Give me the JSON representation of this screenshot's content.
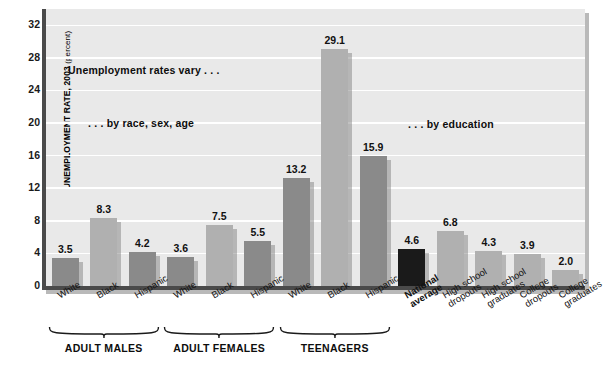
{
  "chart_data": {
    "type": "bar",
    "title": "",
    "xlabel": "",
    "ylabel": "UNEMPLOYMENT RATE, 2003",
    "ylabel_unit": "(percent)",
    "ylim": [
      0,
      34
    ],
    "yticks": [
      0,
      4,
      8,
      12,
      16,
      20,
      24,
      28,
      32
    ],
    "grid": true,
    "legend": "none",
    "categories": [
      "White",
      "Black",
      "Hispanic",
      "White",
      "Black",
      "Hispanic",
      "White",
      "Black",
      "Hispanic",
      "National average",
      "High school dropouts",
      "High school graduates",
      "College dropouts",
      "College graduates"
    ],
    "values": [
      3.5,
      8.3,
      4.2,
      3.6,
      7.5,
      5.5,
      13.2,
      29.1,
      15.9,
      4.6,
      6.8,
      4.3,
      3.9,
      2.0
    ],
    "bars": [
      {
        "label": "White",
        "label_lines": [
          "White"
        ],
        "value": 3.5,
        "shade": "dark",
        "bold": false
      },
      {
        "label": "Black",
        "label_lines": [
          "Black"
        ],
        "value": 8.3,
        "shade": "light",
        "bold": false
      },
      {
        "label": "Hispanic",
        "label_lines": [
          "Hispanic"
        ],
        "value": 4.2,
        "shade": "dark",
        "bold": false
      },
      {
        "label": "White",
        "label_lines": [
          "White"
        ],
        "value": 3.6,
        "shade": "dark",
        "bold": false
      },
      {
        "label": "Black",
        "label_lines": [
          "Black"
        ],
        "value": 7.5,
        "shade": "light",
        "bold": false
      },
      {
        "label": "Hispanic",
        "label_lines": [
          "Hispanic"
        ],
        "value": 5.5,
        "shade": "dark",
        "bold": false
      },
      {
        "label": "White",
        "label_lines": [
          "White"
        ],
        "value": 13.2,
        "shade": "dark",
        "bold": false
      },
      {
        "label": "Black",
        "label_lines": [
          "Black"
        ],
        "value": 29.1,
        "shade": "light",
        "bold": false
      },
      {
        "label": "Hispanic",
        "label_lines": [
          "Hispanic"
        ],
        "value": 15.9,
        "shade": "dark",
        "bold": false
      },
      {
        "label": "National average",
        "label_lines": [
          "National",
          "average"
        ],
        "value": 4.6,
        "shade": "black",
        "bold": true
      },
      {
        "label": "High school dropouts",
        "label_lines": [
          "High school",
          "dropouts"
        ],
        "value": 6.8,
        "shade": "light",
        "bold": false
      },
      {
        "label": "High school graduates",
        "label_lines": [
          "High school",
          "graduates"
        ],
        "value": 4.3,
        "shade": "light",
        "bold": false
      },
      {
        "label": "College dropouts",
        "label_lines": [
          "College",
          "dropouts"
        ],
        "value": 3.9,
        "shade": "light",
        "bold": false
      },
      {
        "label": "College graduates",
        "label_lines": [
          "College",
          "graduates"
        ],
        "value": 2.0,
        "shade": "light",
        "bold": false
      }
    ],
    "groups": [
      {
        "name": "ADULT MALES",
        "first": 0,
        "last": 2
      },
      {
        "name": "ADULT FEMALES",
        "first": 3,
        "last": 5
      },
      {
        "name": "TEENAGERS",
        "first": 6,
        "last": 8
      }
    ],
    "annotations": [
      {
        "text": "Unemployment rates vary . . .",
        "x": 68,
        "y": 64
      },
      {
        "text": ". . . by race, sex, age",
        "x": 88,
        "y": 117
      },
      {
        "text": ". . . by education",
        "x": 408,
        "y": 118
      }
    ],
    "colors": {
      "bar_dark": "#8a8a8a",
      "bar_light": "#b0b0b0",
      "bar_black": "#1a1a1a",
      "plot_background": "#e9e9e9",
      "gridline": "#ffffff",
      "axis": "#4a4a4a",
      "text": "#111111"
    }
  }
}
